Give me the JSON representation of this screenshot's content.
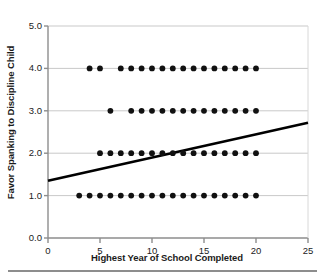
{
  "chart_data": {
    "type": "scatter",
    "title": "",
    "xlabel": "Highest Year of School Completed",
    "ylabel": "Favor Spanking to Discipline Child",
    "xlim": [
      0,
      25
    ],
    "ylim": [
      0.0,
      5.0
    ],
    "xticks": [
      0,
      5,
      10,
      15,
      20,
      25
    ],
    "xtick_labels": [
      "0",
      "5",
      "10",
      "15",
      "20",
      "25"
    ],
    "yticks": [
      0.0,
      1.0,
      2.0,
      3.0,
      4.0,
      5.0
    ],
    "ytick_labels": [
      "0.0",
      "1.0",
      "2.0",
      "3.0",
      "4.0",
      "5.0"
    ],
    "grid": "horizontal",
    "legend": "none",
    "marker_color": "#111111",
    "line_color": "#000000",
    "grid_color": "#c9c9c9",
    "axis_color": "#8d8d8d",
    "rows": [
      {
        "y": 4.0,
        "x": [
          4,
          5,
          7,
          8,
          9,
          10,
          11,
          12,
          13,
          14,
          15,
          16,
          17,
          18,
          19,
          20
        ]
      },
      {
        "y": 3.0,
        "x": [
          6,
          8,
          9,
          10,
          11,
          12,
          13,
          14,
          15,
          16,
          17,
          18,
          19,
          20
        ]
      },
      {
        "y": 2.0,
        "x": [
          5,
          6,
          7,
          8,
          9,
          10,
          11,
          12,
          13,
          14,
          15,
          16,
          17,
          18,
          19,
          20
        ]
      },
      {
        "y": 1.0,
        "x": [
          3,
          4,
          5,
          6,
          7,
          8,
          9,
          10,
          11,
          12,
          13,
          14,
          15,
          16,
          17,
          18,
          19,
          20
        ]
      }
    ],
    "regression_line": {
      "x_start": 0,
      "y_start": 1.35,
      "x_end": 25,
      "y_end": 2.72
    }
  }
}
